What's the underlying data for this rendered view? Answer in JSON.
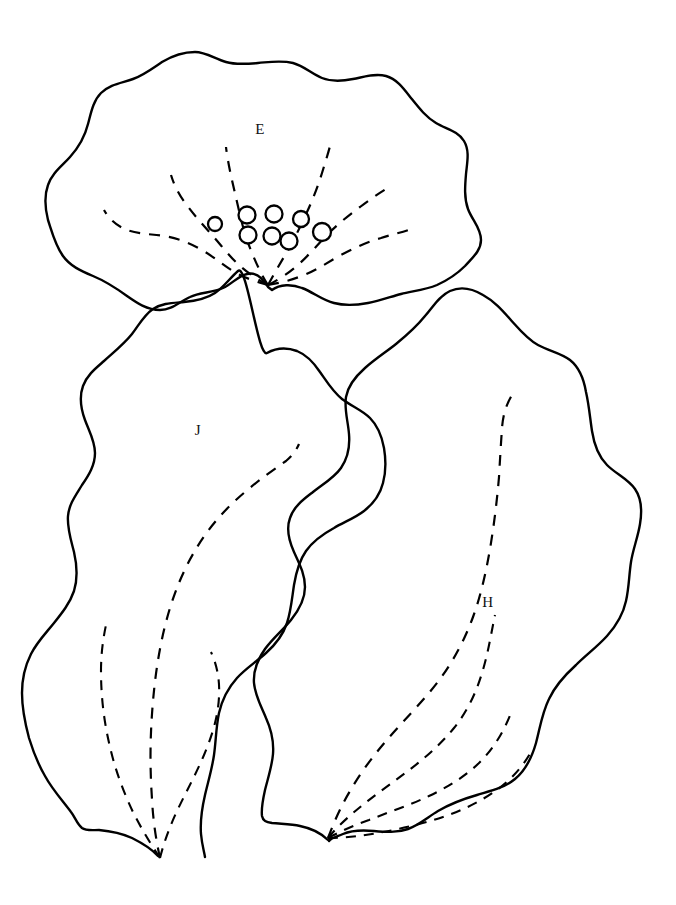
{
  "figure": {
    "background_color": "#ffffff",
    "ink_color": "#000000",
    "width": 676,
    "height": 905,
    "specimens": [
      {
        "id": "E",
        "label": "E",
        "label_x": 260,
        "label_y": 131,
        "description": "broad bilobed leaf outline with fan venation and glandular dots",
        "gland_count": 8,
        "vein_count": 6
      },
      {
        "id": "J",
        "label": "J",
        "label_x": 198,
        "label_y": 432,
        "description": "elongate lobed leaf outline, three dashed veins from base",
        "gland_count": 0,
        "vein_count": 3
      },
      {
        "id": "H",
        "label": "H",
        "label_x": 488,
        "label_y": 604,
        "description": "elongate lobed leaf outline, four dashed veins from base",
        "gland_count": 0,
        "vein_count": 4
      }
    ],
    "glands": [
      {
        "cx": 215,
        "cy": 224,
        "r": 7.0
      },
      {
        "cx": 247,
        "cy": 215,
        "r": 8.5
      },
      {
        "cx": 248,
        "cy": 235,
        "r": 8.5
      },
      {
        "cx": 274,
        "cy": 214,
        "r": 8.5
      },
      {
        "cx": 272,
        "cy": 236,
        "r": 8.5
      },
      {
        "cx": 289,
        "cy": 241,
        "r": 8.5
      },
      {
        "cx": 301,
        "cy": 219,
        "r": 8.0
      },
      {
        "cx": 322,
        "cy": 232,
        "r": 9.0
      }
    ],
    "paths": {
      "outline_E": "M268,287 C262,277 255,272 247,274 C238,276 232,284 223,288 C212,293 200,292 190,297 C179,302 172,310 160,310 C147,310 137,303 127,296 C116,288 105,281 93,276 C81,271 70,266 63,256 C55,245 52,232 48,220 C45,208 44,196 48,185 C52,173 62,166 70,157 C79,147 85,136 88,124 C91,113 93,101 101,93 C110,84 122,83 133,79 C144,75 153,68 162,62 C172,56 183,52 195,52 C206,52 215,59 226,62 C236,65 247,64 258,63 C270,62 281,60 293,63 C304,66 312,74 322,78 C332,82 343,81 353,79 C364,77 375,73 386,76 C397,79 404,89 411,98 C419,108 426,117 436,123 C446,129 458,131 464,141 C470,151 467,163 466,174 C465,186 464,198 468,209 C472,220 481,228 481,240 C481,251 472,258 465,266 C457,274 448,280 437,285 C425,290 413,291 401,294 C390,297 379,301 368,303 C357,305 345,306 334,303 C322,300 313,292 302,288 C292,284 280,284 272,290 Z",
      "vein_E_1": "M268,285 C258,282 247,279 236,273 C224,266 214,257 202,250 C190,243 177,238 164,236 C151,234 138,234 127,230 C117,226 109,219 104,210",
      "vein_E_2": "M268,285 C258,280 248,273 239,265 C229,256 221,245 212,235 C203,225 194,215 186,204 C179,195 174,185 171,175",
      "vein_E_3": "M268,285 C262,276 257,265 252,253 C247,241 243,228 240,215 C237,202 234,189 231,176 C229,166 227,156 226,147",
      "vein_E_4": "M268,285 C274,274 281,262 288,250 C295,238 301,225 307,212 C313,199 318,186 322,173 C325,163 328,154 330,146",
      "vein_E_5": "M268,285 C278,280 289,273 299,264 C309,255 318,244 328,234 C338,224 349,215 360,207 C369,200 378,194 386,189",
      "vein_E_6": "M268,285 C280,283 292,280 304,275 C317,270 328,262 341,255 C354,248 367,242 381,238 C393,234 405,232 416,227",
      "outline_J": "M158,856 C151,848 142,843 132,838 C121,833 110,831 99,830 C92,830 86,831 82,828 C77,824 75,817 71,812 C62,800 52,789 45,776 C38,764 33,751 29,738 C25,723 22,708 22,693 C22,679 25,666 31,654 C37,642 46,633 54,623 C62,613 70,603 74,591 C78,578 77,565 74,552 C71,540 67,528 68,516 C69,504 76,495 82,485 C89,475 95,465 95,453 C95,441 89,431 85,420 C81,409 79,397 83,386 C87,375 96,368 104,361 C114,352 124,344 132,334 C139,325 144,315 153,309 C162,303 173,303 184,302 C195,301 206,299 215,293 C224,287 230,278 238,271 C247,263 258,358 267,353 C276,348 286,347 297,351 C307,355 314,363 320,372 C327,382 333,392 342,399 C351,406 362,410 370,418 C378,426 382,437 384,448 C386,460 386,472 383,483 C380,495 373,504 364,511 C355,518 344,522 334,528 C323,534 313,541 306,551 C299,561 296,573 294,585 C292,598 291,611 287,623 C283,635 275,645 266,653 C256,662 245,669 237,678 C228,688 222,700 219,713 C216,727 216,741 214,755 C212,769 208,782 205,795 C202,808 200,821 201,834 C202,845 204,851 205,857",
      "vein_J_1": "M160,858 C156,840 153,820 152,799 C150,771 150,742 152,714 C154,684 158,654 165,626 C172,598 182,572 196,549 C209,527 226,508 245,492 C259,480 273,470 286,461 C292,456 296,451 299,444",
      "vein_J_2": "M160,858 C150,843 141,828 133,812 C123,791 115,769 110,747 C104,722 101,697 101,671 C101,654 103,639 106,625",
      "vein_J_3": "M160,858 C164,842 170,826 177,811 C186,792 196,774 204,755 C212,736 218,717 219,697 C220,680 217,665 211,652",
      "outline_H": "M328,840 C320,832 310,828 300,826 C291,824 281,824 272,823 C266,822 263,821 262,816 C261,808 263,799 265,790 C268,778 272,766 273,754 C274,741 271,729 266,718 C261,706 255,695 254,683 C253,670 258,659 265,649 C273,638 283,630 291,620 C299,610 305,599 305,587 C305,574 299,563 294,552 C289,541 286,529 290,518 C294,506 304,499 313,492 C323,484 334,478 341,468 C348,458 350,446 349,434 C348,421 344,409 346,397 C348,385 356,376 365,368 C375,359 386,352 396,344 C407,335 417,326 425,316 C433,307 439,296 450,291 C461,286 473,289 483,295 C494,301 502,310 510,319 C519,329 527,339 538,345 C549,351 561,353 570,360 C580,368 584,380 586,392 C589,405 590,418 592,431 C594,444 598,456 607,465 C616,474 628,479 635,489 C642,499 642,512 640,524 C638,537 633,549 631,562 C629,575 629,588 626,601 C623,615 616,626 607,636 C597,647 586,655 576,665 C565,675 555,686 549,699 C542,713 540,728 536,743 C532,757 526,770 515,779 C504,788 490,791 477,795 C463,799 450,804 438,811 C428,817 419,825 408,829 C397,833 385,832 374,831 C363,830 352,830 343,834 C336,837 331,838 329,841",
      "vein_H_1": "M328,838 C334,822 341,806 350,791 C362,770 377,751 393,733 C409,715 426,698 440,679 C454,660 465,639 473,617 C481,595 486,572 490,549 C494,525 497,501 499,477 C500,459 501,443 502,428 C503,415 506,405 512,395",
      "vein_H_2": "M328,838 C337,827 348,817 359,808 C375,795 392,783 408,771 C425,758 441,744 454,728 C467,712 476,693 482,673 C488,654 491,634 495,615",
      "vein_H_3": "M328,838 C341,831 355,825 369,820 C389,812 410,805 429,796 C448,787 466,776 480,762 C494,748 504,731 511,713",
      "vein_H_4": "M328,838 C344,838 361,836 378,833 C400,829 422,824 443,817 C463,810 482,801 498,789 C513,778 525,764 533,748"
    }
  }
}
